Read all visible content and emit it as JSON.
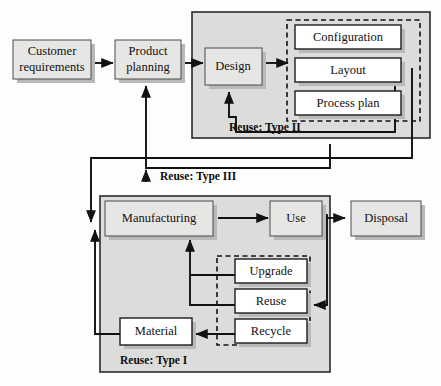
{
  "diagram": {
    "background_color": "#fdfdfc",
    "node_fill_gray": "#e6e6e4",
    "node_fill_white": "#ffffff",
    "container_fill": "#dcdcda",
    "line_color": "#111111"
  },
  "nodes": {
    "customer_requirements_line1": "Customer",
    "customer_requirements_line2": "requirements",
    "product_planning_line1": "Product",
    "product_planning_line2": "planning",
    "design": "Design",
    "configuration": "Configuration",
    "layout": "Layout",
    "process_plan": "Process plan",
    "manufacturing": "Manufacturing",
    "use": "Use",
    "disposal": "Disposal",
    "upgrade": "Upgrade",
    "reuse": "Reuse",
    "recycle": "Recycle",
    "material": "Material"
  },
  "group_labels": {
    "type_one": "Reuse: Type I",
    "type_two": "Reuse: Type II",
    "type_three": "Reuse: Type III"
  }
}
